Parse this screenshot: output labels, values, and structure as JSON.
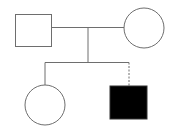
{
  "diagram": {
    "type": "pedigree",
    "colors": {
      "line": "#6e6e6e",
      "affected_fill": "#000000",
      "unaffected_fill": "#ffffff",
      "background": "#ffffff"
    },
    "individuals": [
      {
        "id": "father",
        "sex": "male",
        "shape": "square",
        "affected": false,
        "generation": 1
      },
      {
        "id": "mother",
        "sex": "female",
        "shape": "circle",
        "affected": false,
        "generation": 1
      },
      {
        "id": "daughter",
        "sex": "female",
        "shape": "circle",
        "affected": false,
        "generation": 2,
        "relation": "biological"
      },
      {
        "id": "son",
        "sex": "male",
        "shape": "square",
        "affected": true,
        "generation": 2,
        "relation": "adopted/non-biological (dashed line)"
      }
    ],
    "relationships": [
      {
        "type": "mating",
        "between": [
          "father",
          "mother"
        ]
      },
      {
        "type": "offspring",
        "parents": [
          "father",
          "mother"
        ],
        "children": [
          "daughter",
          "son"
        ]
      }
    ]
  }
}
